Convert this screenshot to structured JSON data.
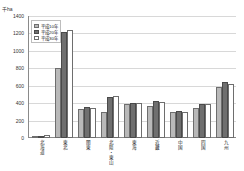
{
  "chart_data": {
    "type": "bar",
    "title": "",
    "unit_label": "千ha",
    "xlabel": "",
    "ylabel": "千ha",
    "ylim": [
      0,
      1400
    ],
    "ytick_values": [
      0,
      200,
      400,
      600,
      800,
      1000,
      1200,
      1400
    ],
    "ytick_labels": [
      "0",
      "200",
      "400",
      "600",
      "800",
      "1000",
      "1200",
      "1400"
    ],
    "grid": true,
    "legend_position": "top-left",
    "categories": [
      "北海道",
      "東北",
      "関東",
      "北陸・東山",
      "東海",
      "近畿",
      "中国",
      "四国",
      "九州"
    ],
    "series": [
      {
        "name": "平成10年",
        "color": "#b9b9b9",
        "values": [
          20,
          800,
          330,
          300,
          390,
          370,
          300,
          340,
          580
        ]
      },
      {
        "name": "平成20年",
        "color": "#6f6f6f",
        "values": [
          25,
          1220,
          355,
          470,
          405,
          430,
          305,
          395,
          640
        ]
      },
      {
        "name": "平成30年",
        "color": "#ffffff",
        "values": [
          35,
          1245,
          350,
          480,
          405,
          415,
          300,
          390,
          620
        ]
      }
    ]
  },
  "legend": {
    "items": [
      {
        "label": "平成10年"
      },
      {
        "label": "平成20年"
      },
      {
        "label": "平成30年"
      }
    ]
  }
}
